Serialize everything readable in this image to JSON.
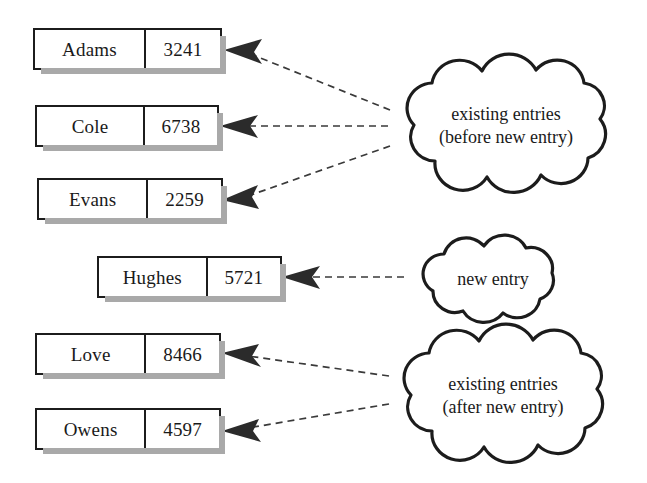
{
  "diagram": {
    "records": [
      {
        "id": "record-adams",
        "name": "Adams",
        "value": "3241",
        "group": "before"
      },
      {
        "id": "record-cole",
        "name": "Cole",
        "value": "6738",
        "group": "before"
      },
      {
        "id": "record-evans",
        "name": "Evans",
        "value": "2259",
        "group": "before"
      },
      {
        "id": "record-hughes",
        "name": "Hughes",
        "value": "5721",
        "group": "new"
      },
      {
        "id": "record-love",
        "name": "Love",
        "value": "8466",
        "group": "after"
      },
      {
        "id": "record-owens",
        "name": "Owens",
        "value": "4597",
        "group": "after"
      }
    ],
    "clouds": [
      {
        "id": "cloud-existing-before",
        "line1": "existing entries",
        "line2": "(before new entry)",
        "text": "existing entries\n(before new entry)"
      },
      {
        "id": "cloud-new-entry",
        "line1": "new entry",
        "line2": "",
        "text": "new entry"
      },
      {
        "id": "cloud-existing-after",
        "line1": "existing entries",
        "line2": "(after new entry)",
        "text": "existing entries\n(after new entry)"
      }
    ],
    "connectors": [
      {
        "id": "connector-adams",
        "from": "cloud-existing-before",
        "to": "record-adams"
      },
      {
        "id": "connector-cole",
        "from": "cloud-existing-before",
        "to": "record-cole"
      },
      {
        "id": "connector-evans",
        "from": "cloud-existing-before",
        "to": "record-evans"
      },
      {
        "id": "connector-hughes",
        "from": "cloud-new-entry",
        "to": "record-hughes"
      },
      {
        "id": "connector-love",
        "from": "cloud-existing-after",
        "to": "record-love"
      },
      {
        "id": "connector-owens",
        "from": "cloud-existing-after",
        "to": "record-owens"
      }
    ],
    "colors": {
      "background": "#ffffff",
      "outline": "#1c1c1c",
      "shadow": "#a9a9a9",
      "connector": "#3a3a3a",
      "arrow": "#2b2b2b",
      "text": "#1a1a1a"
    }
  }
}
